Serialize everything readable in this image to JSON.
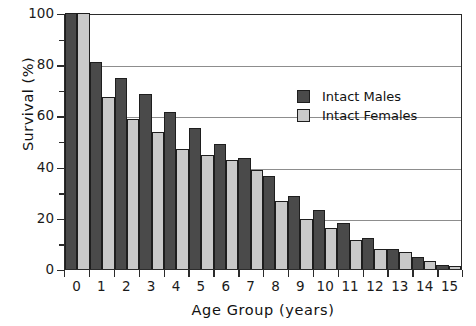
{
  "chart_data": {
    "type": "bar",
    "title": "",
    "xlabel": "Age  Group  (years)",
    "ylabel": "Survival  (%)",
    "categories": [
      "0",
      "1",
      "2",
      "3",
      "4",
      "5",
      "6",
      "7",
      "8",
      "9",
      "10",
      "11",
      "12",
      "13",
      "14",
      "15"
    ],
    "series": [
      {
        "name": "Intact Males",
        "color": "#4a4a4a",
        "values": [
          100,
          81,
          74.5,
          68.5,
          61.5,
          55,
          49,
          43.5,
          36.5,
          28.5,
          23,
          18,
          12,
          8,
          4.5,
          1.5
        ]
      },
      {
        "name": "Intact Females",
        "color": "#c9c9c9",
        "values": [
          100,
          67,
          58.5,
          53.5,
          47,
          44.5,
          42.5,
          38.5,
          26.5,
          19.5,
          16,
          11.5,
          8,
          6.5,
          3,
          1
        ]
      }
    ],
    "ylim": [
      0,
      100
    ],
    "y_major_ticks": [
      0,
      20,
      40,
      60,
      80,
      100
    ],
    "y_minor_ticks": [
      10,
      30,
      50,
      70,
      90
    ],
    "y_tick_labels": [
      "0",
      "20",
      "40",
      "60",
      "80",
      "100"
    ],
    "grid": "horizontal-major",
    "legend_position": "upper-right-inside"
  },
  "axes": {
    "y_title": "Survival   (%)",
    "x_title": "Age  Group  (years)"
  },
  "legend": {
    "entries": [
      {
        "label": "Intact Males",
        "swatch": "male-swatch"
      },
      {
        "label": "Intact Females",
        "swatch": "female-swatch"
      }
    ]
  }
}
